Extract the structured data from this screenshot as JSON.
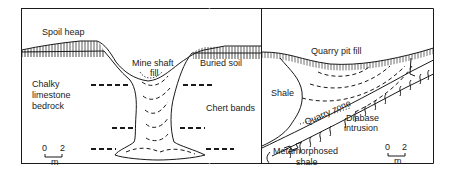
{
  "left_panel": {
    "labels": {
      "spoil_heap": "Spoil heap",
      "mine_shaft_fill_1": "Mine shaft",
      "mine_shaft_fill_2": "fill",
      "buried_soil": "Buried soil",
      "bedrock_1": "Chalky",
      "bedrock_2": "limestone",
      "bedrock_3": "bedrock",
      "chert_bands": "Chert bands"
    },
    "scale": {
      "start": "0",
      "end": "2",
      "unit": "m"
    }
  },
  "right_panel": {
    "labels": {
      "quarry_pit_fill": "Quarry pit fill",
      "shale": "Shale",
      "quarry_zone": "Quarry zone",
      "diabase_1": "Diabase",
      "diabase_2": "intrusion",
      "metamorphosed_1": "Metamorphosed",
      "metamorphosed_2": "shale"
    },
    "scale": {
      "start": "0",
      "end": "2",
      "unit": "m"
    }
  },
  "colors": {
    "line": "#1a1a1a",
    "background": "#ffffff"
  }
}
